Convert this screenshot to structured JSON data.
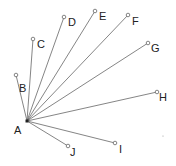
{
  "diagram": {
    "type": "radial-line-fan",
    "line_color": "#666666",
    "center": {
      "id": "A",
      "label": "A",
      "x": 27,
      "y": 121,
      "label_x": 14,
      "label_y": 134
    },
    "endpoints": [
      {
        "id": "B",
        "label": "B",
        "x": 16,
        "y": 75,
        "label_x": 19,
        "label_y": 92
      },
      {
        "id": "C",
        "label": "C",
        "x": 33,
        "y": 39,
        "label_x": 37,
        "label_y": 48
      },
      {
        "id": "D",
        "label": "D",
        "x": 64,
        "y": 17,
        "label_x": 68,
        "label_y": 26
      },
      {
        "id": "E",
        "label": "E",
        "x": 95,
        "y": 11,
        "label_x": 99,
        "label_y": 20
      },
      {
        "id": "F",
        "label": "F",
        "x": 128,
        "y": 15,
        "label_x": 132,
        "label_y": 25
      },
      {
        "id": "G",
        "label": "G",
        "x": 148,
        "y": 43,
        "label_x": 151,
        "label_y": 52
      },
      {
        "id": "H",
        "label": "H",
        "x": 157,
        "y": 92,
        "label_x": 159,
        "label_y": 101
      },
      {
        "id": "I",
        "label": "I",
        "x": 115,
        "y": 143,
        "label_x": 119,
        "label_y": 153
      },
      {
        "id": "J",
        "label": "J",
        "x": 68,
        "y": 146,
        "label_x": 70,
        "label_y": 156
      }
    ],
    "stray_dot": {
      "x": 163,
      "y": 136
    }
  }
}
